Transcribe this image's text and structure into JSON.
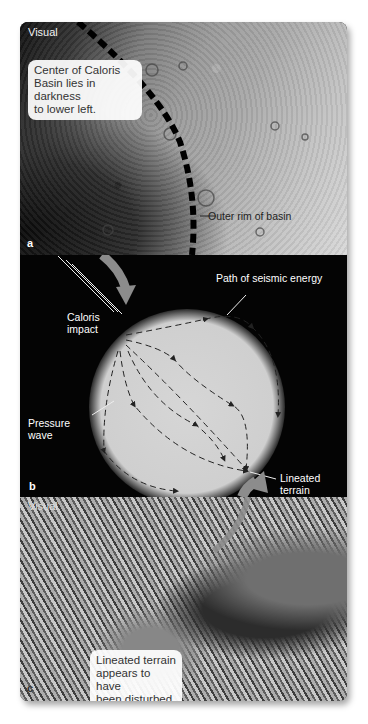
{
  "figure": {
    "panels": [
      {
        "id": "a",
        "letter": "a",
        "mode_label": "Visual",
        "callout": [
          "Center of Caloris",
          "Basin lies in darkness",
          "to lower left."
        ],
        "annotation": "Outer rim of basin"
      },
      {
        "id": "b",
        "letter": "b",
        "labels": {
          "seismic_path": "Path of seismic energy",
          "impact_line1": "Caloris",
          "impact_line2": "impact",
          "pressure_line1": "Pressure",
          "pressure_line2": "wave",
          "terrain_line1": "Lineated",
          "terrain_line2": "terrain"
        }
      },
      {
        "id": "c",
        "letter": "c",
        "mode_label": "Visual",
        "callout": [
          "Lineated terrain",
          "appears to have",
          "been disturbed."
        ]
      }
    ],
    "colors": {
      "planet": "#d4d4d4",
      "background_b": "#040404",
      "arrow": "#8c8c8c",
      "callout_bg": "#f4f4f4"
    }
  }
}
